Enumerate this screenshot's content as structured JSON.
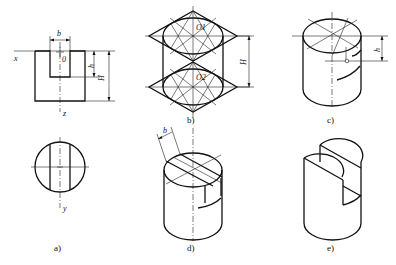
{
  "figure": {
    "panels": [
      {
        "id": "a",
        "caption": "a)",
        "description": "Front view and top view of cylinder with slot"
      },
      {
        "id": "b",
        "caption": "b)",
        "description": "Isometric ellipse construction for top and bottom faces"
      },
      {
        "id": "c",
        "caption": "c)",
        "description": "Locating slot depth h on cylinder"
      },
      {
        "id": "d",
        "caption": "d)",
        "description": "Drawing slot width b on top face"
      },
      {
        "id": "e",
        "caption": "e)",
        "description": "Finished slotted cylinder"
      }
    ],
    "labels": {
      "x_axis": "x",
      "z_axis": "z",
      "y_axis": "y",
      "origin": "0",
      "slot_width": "b",
      "slot_depth": "h",
      "height": "H",
      "center_top": "O1",
      "center_bottom": "O2"
    }
  }
}
